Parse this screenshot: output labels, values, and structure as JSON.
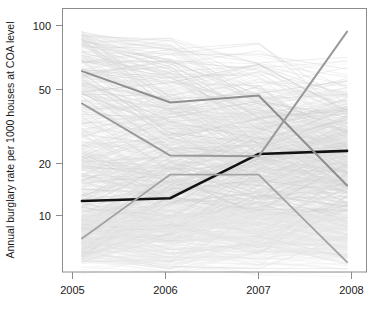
{
  "chart_data": {
    "type": "line",
    "title": "",
    "subtitle": "",
    "xlabel": "",
    "ylabel": "Annual burglary rate per 1000 houses at COA level",
    "x": [
      2005,
      2006,
      2007,
      2008
    ],
    "xtick_labels": [
      "2005",
      "2006",
      "2007",
      "2008"
    ],
    "ytick_values": [
      10,
      20,
      50,
      100
    ],
    "ytick_labels": [
      "10",
      "20",
      "50",
      "100"
    ],
    "yscale": "log",
    "ylim": [
      4.6,
      125
    ],
    "xlim": [
      2004.78,
      2008.22
    ],
    "grid": false,
    "legend": false,
    "legend_position": "none",
    "annotations": [],
    "series": [
      {
        "name": "highlighted-black",
        "color": "#111111",
        "width": 2.6,
        "emphasis": "bold",
        "values": [
          11.2,
          11.6,
          20.2,
          21.0
        ]
      },
      {
        "name": "highlighted-grey-1",
        "color": "#8f8f8f",
        "width": 2.0,
        "emphasis": "medium",
        "values": [
          57.0,
          38.5,
          42.0,
          13.6
        ]
      },
      {
        "name": "highlighted-grey-2",
        "color": "#9a9a9a",
        "width": 2.0,
        "emphasis": "medium",
        "values": [
          38.0,
          19.8,
          19.6,
          93.5
        ]
      },
      {
        "name": "highlighted-grey-3",
        "color": "#a3a3a3",
        "width": 1.8,
        "emphasis": "medium",
        "values": [
          7.0,
          15.6,
          15.6,
          5.2
        ]
      }
    ],
    "background_series_note": "several hundred near-transparent light grey COA trajectories forming the spaghetti background",
    "background_color": "#e2e2e2"
  },
  "axes": {
    "y_axis_title": "Annual burglary rate per 1000 houses at COA level",
    "x_tick_2005": "2005",
    "x_tick_2006": "2006",
    "x_tick_2007": "2007",
    "x_tick_2008": "2008",
    "y_tick_10": "10",
    "y_tick_20": "20",
    "y_tick_50": "50",
    "y_tick_100": "100"
  }
}
